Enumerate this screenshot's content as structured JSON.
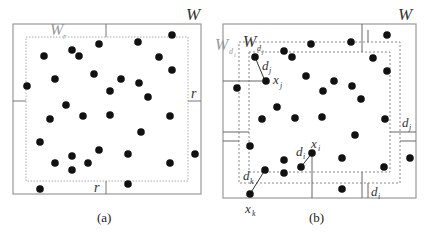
{
  "panels": [
    {
      "id": "a",
      "caption": "(a)",
      "outer_label": "W",
      "inner_label": "W",
      "inner_label_sub": "r",
      "margin_label_right": "r",
      "margin_label_bottom": "r",
      "outer_box": {
        "x": 13,
        "y": 24,
        "w": 188,
        "h": 170
      },
      "inner_box": {
        "x": 26,
        "y": 37,
        "w": 162,
        "h": 144
      },
      "points": [
        [
          27,
          86
        ],
        [
          44,
          56
        ],
        [
          72,
          50
        ],
        [
          79,
          56
        ],
        [
          99,
          44
        ],
        [
          55,
          79
        ],
        [
          94,
          74
        ],
        [
          110,
          91
        ],
        [
          121,
          79
        ],
        [
          139,
          83
        ],
        [
          148,
          97
        ],
        [
          138,
          42
        ],
        [
          172,
          35
        ],
        [
          159,
          57
        ],
        [
          172,
          70
        ],
        [
          66,
          105
        ],
        [
          50,
          119
        ],
        [
          83,
          116
        ],
        [
          110,
          115
        ],
        [
          170,
          116
        ],
        [
          141,
          132
        ],
        [
          40,
          142
        ],
        [
          55,
          163
        ],
        [
          72,
          156
        ],
        [
          72,
          170
        ],
        [
          88,
          163
        ],
        [
          99,
          150
        ],
        [
          128,
          154
        ],
        [
          170,
          163
        ],
        [
          195,
          154
        ],
        [
          40,
          189
        ],
        [
          128,
          184
        ]
      ]
    },
    {
      "id": "b",
      "caption": "(b)",
      "outer_label": "W",
      "region_di_label": "W",
      "region_di_sub": "d",
      "region_di_subsub": "i",
      "region_dj_label": "W",
      "region_dj_sub": "d",
      "region_dj_subsub": "j",
      "label_dj": "d",
      "label_dj_sub": "j",
      "label_xj": "x",
      "label_xj_sub": "j",
      "label_di": "d",
      "label_di_sub": "i",
      "label_xi": "x",
      "label_xi_sub": "i",
      "label_dk": "d",
      "label_dk_sub": "k",
      "label_xk": "x",
      "label_xk_sub": "k",
      "margin_right_label": "d",
      "margin_right_sub": "j",
      "margin_bottom_label": "d",
      "margin_bottom_sub": "i",
      "outer_box": {
        "x": 223,
        "y": 24,
        "w": 193,
        "h": 174
      },
      "region_di_box": {
        "x": 239,
        "y": 42,
        "w": 161,
        "h": 141
      },
      "region_dj_box": {
        "x": 249,
        "y": 52,
        "w": 141,
        "h": 120
      },
      "points": [
        [
          237,
          88
        ],
        [
          255,
          57
        ],
        [
          267,
          51
        ],
        [
          276,
          57
        ],
        [
          311,
          44
        ],
        [
          264,
          81
        ],
        [
          306,
          76
        ],
        [
          320,
          91
        ],
        [
          340,
          83
        ],
        [
          352,
          86
        ],
        [
          362,
          99
        ],
        [
          351,
          42
        ],
        [
          387,
          35
        ],
        [
          373,
          58
        ],
        [
          387,
          71
        ],
        [
          277,
          107
        ],
        [
          262,
          119
        ],
        [
          295,
          118
        ],
        [
          322,
          117
        ],
        [
          385,
          119
        ],
        [
          355,
          135
        ],
        [
          250,
          146
        ],
        [
          265,
          170
        ],
        [
          284,
          160
        ],
        [
          284,
          173
        ],
        [
          301,
          167
        ],
        [
          312,
          153
        ],
        [
          342,
          158
        ],
        [
          384,
          167
        ],
        [
          410,
          158
        ],
        [
          250,
          194
        ],
        [
          342,
          189
        ]
      ]
    }
  ]
}
